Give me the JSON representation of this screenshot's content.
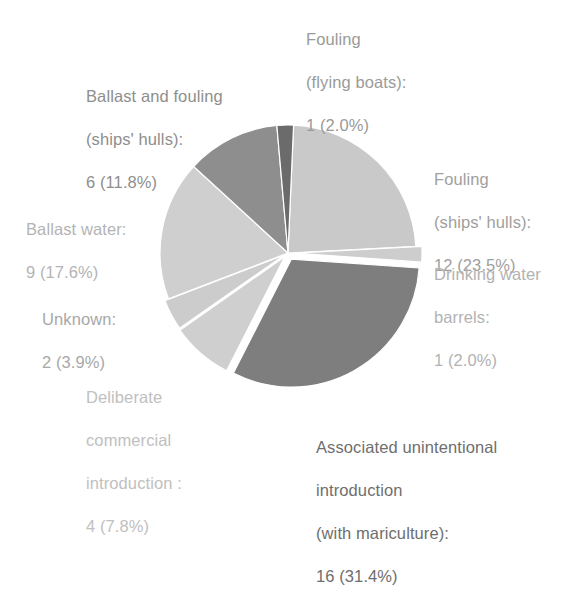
{
  "figure": {
    "background_color": "#ffffff",
    "type": "pie-chart-figure"
  },
  "chart_data": {
    "type": "pie",
    "title": "",
    "subtitle": "",
    "xlabel": "",
    "ylabel": "",
    "total": 51,
    "units": "records",
    "legend_position": "none (direct callout labels around pie)",
    "grid": false,
    "exploded": true,
    "start_angle_deg": 0,
    "direction": "clockwise",
    "categories": [
      "Fouling (ships' hulls)",
      "Drinking water barrels",
      "Associated unintentional introduction (with mariculture)",
      "Deliberate commercial introduction",
      "Unknown",
      "Ballast water",
      "Ballast and fouling (ships' hulls)",
      "Fouling (flying boats)"
    ],
    "values": [
      12,
      1,
      16,
      4,
      2,
      9,
      6,
      1
    ],
    "percents": [
      23.5,
      2.0,
      31.4,
      7.8,
      3.9,
      17.6,
      11.8,
      2.0
    ],
    "colors": [
      "#c9c9c9",
      "#cdcdcd",
      "#7e7e7e",
      "#cfcfcf",
      "#cccccc",
      "#cfcfcf",
      "#8e8e8e",
      "#6b6b6b"
    ],
    "slices": [
      {
        "key": "fouling-ships-hulls",
        "name": "Fouling (ships' hulls)",
        "count": 12,
        "percent": 23.5,
        "color": "#c9c9c9",
        "start_angle_deg": 2.5,
        "end_angle_deg": 87.0,
        "explode": 0
      },
      {
        "key": "drinking-water-barrels",
        "name": "Drinking water barrels",
        "count": 1,
        "percent": 2.0,
        "color": "#cdcdcd",
        "start_angle_deg": 87.0,
        "end_angle_deg": 94.0,
        "explode": 6
      },
      {
        "key": "associated-unintentional-introduction",
        "name": "Associated unintentional introduction (with mariculture)",
        "count": 16,
        "percent": 31.4,
        "color": "#7e7e7e",
        "start_angle_deg": 94.0,
        "end_angle_deg": 207.0,
        "explode": 7
      },
      {
        "key": "deliberate-commercial-introduction",
        "name": "Deliberate commercial introduction",
        "count": 4,
        "percent": 7.8,
        "color": "#cfcfcf",
        "start_angle_deg": 207.0,
        "end_angle_deg": 235.0,
        "explode": 5
      },
      {
        "key": "unknown",
        "name": "Unknown",
        "count": 2,
        "percent": 3.9,
        "color": "#cccccc",
        "start_angle_deg": 235.0,
        "end_angle_deg": 249.0,
        "explode": 4
      },
      {
        "key": "ballast-water",
        "name": "Ballast water",
        "count": 9,
        "percent": 17.6,
        "color": "#cfcfcf",
        "start_angle_deg": 249.0,
        "end_angle_deg": 312.5,
        "explode": 0
      },
      {
        "key": "ballast-and-fouling-ships-hulls",
        "name": "Ballast and fouling (ships' hulls)",
        "count": 6,
        "percent": 11.8,
        "color": "#8e8e8e",
        "start_angle_deg": 312.5,
        "end_angle_deg": 355.0,
        "explode": 0
      },
      {
        "key": "fouling-flying-boats",
        "name": "Fouling (flying boats)",
        "count": 1,
        "percent": 2.0,
        "color": "#6b6b6b",
        "start_angle_deg": 355.0,
        "end_angle_deg": 362.5,
        "explode": 0
      }
    ]
  },
  "labels": {
    "flying_boats": {
      "line1": "Fouling",
      "line2": "(flying boats):",
      "value": "1 (2.0%)"
    },
    "ballast_and_fouling": {
      "line1": "Ballast and fouling",
      "line2": "(ships' hulls):",
      "value": "6 (11.8%)"
    },
    "fouling_hulls": {
      "line1": "Fouling",
      "line2": "(ships' hulls):",
      "value": "12 (23.5%)"
    },
    "ballast_water": {
      "line1": "Ballast water:",
      "value": "9 (17.6%)"
    },
    "drinking_water": {
      "line1": "Drinking water",
      "line2": "barrels:",
      "value": "1 (2.0%)"
    },
    "unknown": {
      "line1": "Unknown:",
      "value": "2 (3.9%)"
    },
    "deliberate": {
      "line1": "Deliberate",
      "line2": "commercial",
      "line3": "introduction :",
      "value": "4 (7.8%)"
    },
    "associated": {
      "line1": "Associated unintentional",
      "line2": "introduction",
      "line3": "(with mariculture):",
      "value": "16 (31.4%)"
    }
  }
}
